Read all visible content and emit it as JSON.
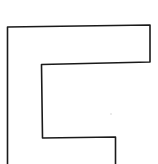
{
  "diagram": {
    "shape": "outline-polyline",
    "stroke_color": "#1a1a1a",
    "background": "#ffffff",
    "points": "7.5,164 7.5,27 150,25 150,62 41.5,64.5 42.5,138 115.5,137 115.5,164",
    "speck": {
      "cx": 111,
      "cy": 114,
      "color": "#c8c8c8"
    }
  }
}
